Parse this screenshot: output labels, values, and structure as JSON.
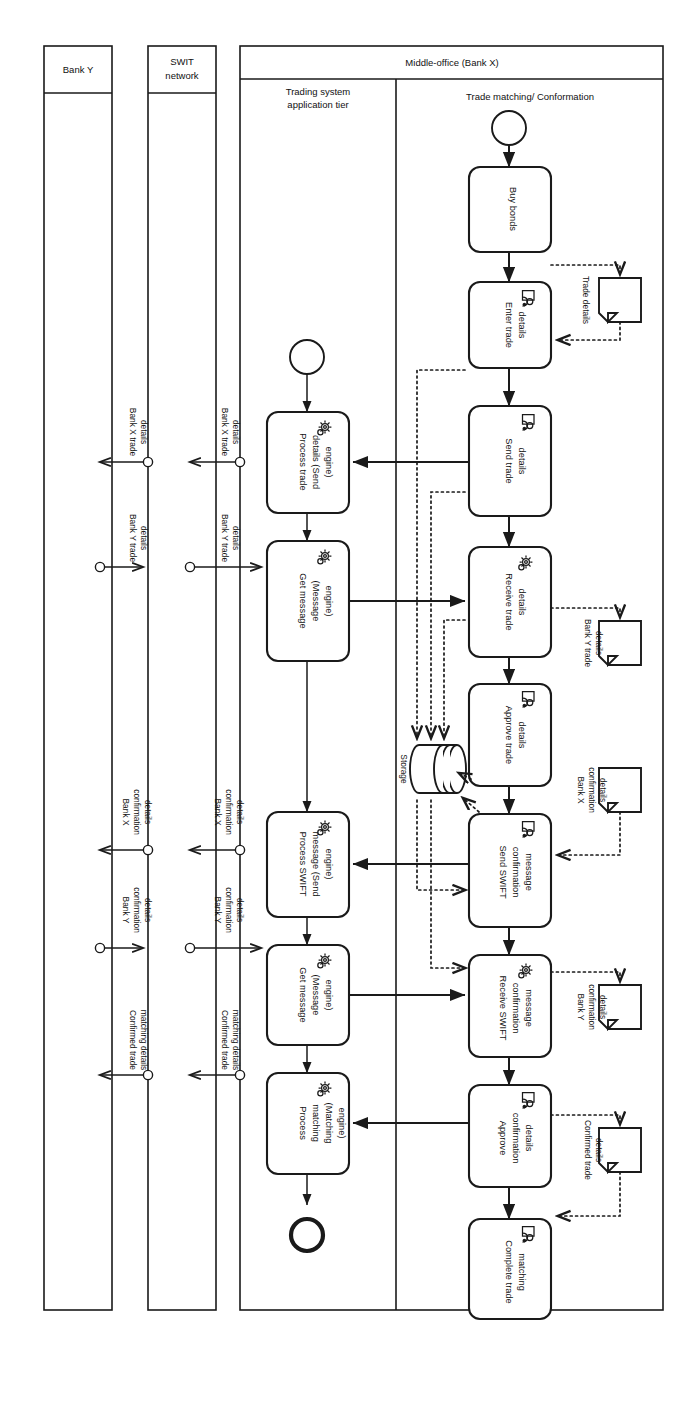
{
  "diagram": {
    "orientation": "rotated-90-clockwise",
    "pools": [
      {
        "id": "bank-y",
        "name": "Bank Y",
        "lanes": []
      },
      {
        "id": "swift",
        "name": "SWIT network",
        "lanes": []
      },
      {
        "id": "middle-office",
        "name": "Middle-office (Bank X)",
        "lanes": [
          {
            "id": "trading-tier",
            "name": "Trading system application tier"
          },
          {
            "id": "trade-matching",
            "name": "Trade matching/ Conformation"
          }
        ]
      }
    ],
    "tasks": [
      {
        "id": "t1",
        "lane": "trade-matching",
        "label": "Buy bonds",
        "icon": "none"
      },
      {
        "id": "t2",
        "lane": "trade-matching",
        "label": "Enter trade details",
        "icon": "user-icon"
      },
      {
        "id": "t3",
        "lane": "trade-matching",
        "label": "Send trade details",
        "icon": "user-icon"
      },
      {
        "id": "t4",
        "lane": "trade-matching",
        "label": "Receive trade details",
        "icon": "gear-icon"
      },
      {
        "id": "t5",
        "lane": "trade-matching",
        "label": "Approve trade details",
        "icon": "user-icon"
      },
      {
        "id": "t6",
        "lane": "trade-matching",
        "label": "Send SWIFT confirmation message",
        "icon": "user-icon"
      },
      {
        "id": "t7",
        "lane": "trade-matching",
        "label": "Receive SWIFT confirmation message",
        "icon": "gear-icon"
      },
      {
        "id": "t8",
        "lane": "trade-matching",
        "label": "Approve confirmation details",
        "icon": "user-icon"
      },
      {
        "id": "t9",
        "lane": "trade-matching",
        "label": "Complete trade matching",
        "icon": "user-icon"
      },
      {
        "id": "a1",
        "lane": "trading-tier",
        "label": "Process trade details (Send engine)",
        "icon": "gear-icon"
      },
      {
        "id": "a2",
        "lane": "trading-tier",
        "label": "Get message (Message engine)",
        "icon": "gear-icon"
      },
      {
        "id": "a3",
        "lane": "trading-tier",
        "label": "Process SWIFT message (Send engine)",
        "icon": "gear-icon"
      },
      {
        "id": "a4",
        "lane": "trading-tier",
        "label": "Get message (Message engine)",
        "icon": "gear-icon"
      },
      {
        "id": "a5",
        "lane": "trading-tier",
        "label": "Process matching (Matching engine)",
        "icon": "gear-icon"
      }
    ],
    "events": [
      {
        "id": "e-start-mo",
        "type": "start",
        "lane": "trade-matching"
      },
      {
        "id": "e-start-tt",
        "type": "start",
        "lane": "trading-tier"
      },
      {
        "id": "e-end-tt",
        "type": "end",
        "lane": "trading-tier"
      },
      {
        "id": "e-end-mo",
        "type": "end",
        "lane": "trade-matching"
      }
    ],
    "data_objects": [
      {
        "id": "d1",
        "label": "Trade details"
      },
      {
        "id": "d2",
        "label": "Bank Y trade details"
      },
      {
        "id": "d3",
        "label": "Bank X confirmation details"
      },
      {
        "id": "d4",
        "label": "Bank Y confirmation details"
      },
      {
        "id": "d5",
        "label": "Confirmed trade details"
      }
    ],
    "data_store": {
      "id": "ds1",
      "label": "Storage"
    },
    "message_flows": [
      {
        "id": "m1",
        "label": "Bank X trade details",
        "from": "middle-office",
        "to": "swift"
      },
      {
        "id": "m2",
        "label": "Bank X trade details",
        "from": "swift",
        "to": "bank-y"
      },
      {
        "id": "m3",
        "label": "Bank Y trade details",
        "from": "bank-y",
        "to": "swift"
      },
      {
        "id": "m4",
        "label": "Bank Y trade details",
        "from": "swift",
        "to": "middle-office"
      },
      {
        "id": "m5",
        "label": "Bank X confirmation details",
        "from": "middle-office",
        "to": "swift"
      },
      {
        "id": "m6",
        "label": "Bank X confirmation details",
        "from": "swift",
        "to": "bank-y"
      },
      {
        "id": "m7",
        "label": "Bank Y confirmation details",
        "from": "bank-y",
        "to": "swift"
      },
      {
        "id": "m8",
        "label": "Bank Y confirmation details",
        "from": "swift",
        "to": "middle-office"
      },
      {
        "id": "m9",
        "label": "Confirmed trade matching details",
        "from": "middle-office",
        "to": "swift"
      },
      {
        "id": "m10",
        "label": "Confirmed trade matching details",
        "from": "swift",
        "to": "bank-y"
      }
    ]
  }
}
